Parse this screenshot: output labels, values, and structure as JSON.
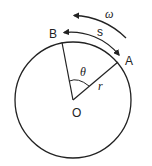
{
  "diagram": {
    "colors": {
      "stroke": "#222222",
      "background": "#ffffff"
    },
    "circle": {
      "center": [
        73,
        100
      ],
      "radius": 58
    },
    "points": {
      "A": {
        "label": "A",
        "position": [
          118,
          62
        ]
      },
      "B": {
        "label": "B",
        "position": [
          62,
          42
        ]
      },
      "O": {
        "label": "O",
        "position": [
          73,
          100
        ]
      }
    },
    "labels": {
      "B": "B",
      "A": "A",
      "O": "O",
      "theta": "θ",
      "r": "r",
      "s": "s",
      "omega": "ω"
    },
    "annotations": [
      {
        "name": "arc-length",
        "symbol": "s",
        "description": "double-headed arc arrow between A and B"
      },
      {
        "name": "angular-velocity",
        "symbol": "ω",
        "description": "counter-clockwise arc arrow"
      },
      {
        "name": "angle",
        "symbol": "θ",
        "description": "angle between OB and OA"
      },
      {
        "name": "radius",
        "symbol": "r",
        "description": "segment from O to A"
      }
    ]
  }
}
